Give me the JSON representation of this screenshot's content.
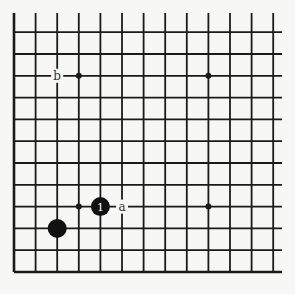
{
  "diagram": {
    "type": "go-board-corner",
    "grid": {
      "columns": 13,
      "rows": 12,
      "open_top": true,
      "open_right": true,
      "edges": [
        "left",
        "bottom"
      ]
    },
    "colors": {
      "background": "#f7f7f5",
      "line": "#1a1a1a",
      "stone_black": "#111111",
      "label_bg": "#f7f7f5"
    },
    "star_points": [
      [
        3,
        2
      ],
      [
        9,
        2
      ],
      [
        3,
        8
      ],
      [
        9,
        8
      ]
    ],
    "stones": [
      {
        "color": "black",
        "col": 4,
        "row": 8,
        "number": "1"
      },
      {
        "color": "black",
        "col": 2,
        "row": 9,
        "number": ""
      }
    ],
    "labels": [
      {
        "text": "a",
        "col": 5,
        "row": 8
      },
      {
        "text": "b",
        "col": 2,
        "row": 2
      }
    ]
  }
}
